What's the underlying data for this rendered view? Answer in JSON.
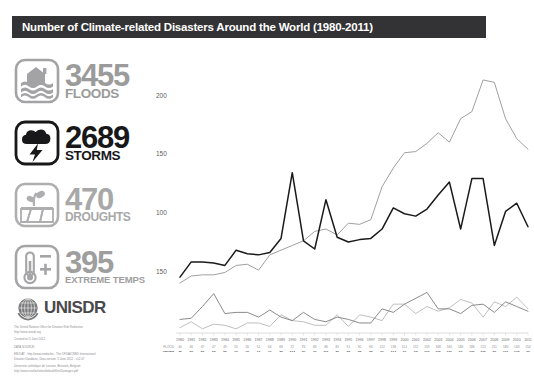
{
  "header": {
    "title": "Number of Climate-related Disasters Around the World (1980-2011)",
    "bar_color": "#333234"
  },
  "stats": [
    {
      "key": "floods",
      "number": "3455",
      "label": "FLOODS",
      "icon": "flood-house-waves-icon",
      "color": "#9b9b9b"
    },
    {
      "key": "storms",
      "number": "2689",
      "label": "STORMS",
      "icon": "storm-cloud-lightning-icon",
      "color": "#18181a"
    },
    {
      "key": "droughts",
      "number": "470",
      "label": "DROUGHTS",
      "icon": "drought-cracked-earth-plant-icon",
      "color": "#a8a8a8"
    },
    {
      "key": "temps",
      "number": "395",
      "label": "EXTREME TEMPS",
      "icon": "thermometer-plus-minus-icon",
      "color": "#9e9e9e"
    }
  ],
  "organization": {
    "logo_icon": "un-globe-laurel-icon",
    "name": "UNISDR",
    "fine_print": [
      "The United Nations Office for Disaster Risk Reduction",
      "http://www.unisdr.org",
      "Created on 5 June 2012",
      "DATA SOURCE:",
      "EM-DAT - http://www.emdat.be - The OFDA/CRED International",
      "Disaster Database, Data version: 5 June 2012 - v12.07",
      "Universite catholique de Louvain, Brussels, Belgium",
      "http://www.cred.be/sites/default/files/Damages.pdf"
    ]
  },
  "chart_data": {
    "type": "line",
    "title": "Number of Climate-related Disasters Around the World (1980-2011)",
    "xlabel": "",
    "ylabel": "",
    "ylim": [
      0,
      230
    ],
    "yticks": [
      50,
      100,
      150,
      200
    ],
    "ytick_labels": [
      "150",
      "100",
      "150",
      "200"
    ],
    "grid": false,
    "legend_position": "left-sidebar-icons",
    "categories": [
      "1980",
      "1981",
      "1982",
      "1983",
      "1984",
      "1985",
      "1986",
      "1987",
      "1988",
      "1989",
      "1990",
      "1991",
      "1992",
      "1993",
      "1994",
      "1995",
      "1996",
      "1997",
      "1998",
      "1999",
      "2000",
      "2001",
      "2002",
      "2003",
      "2004",
      "2005",
      "2006",
      "2007",
      "2008",
      "2009",
      "2010",
      "2011"
    ],
    "series": [
      {
        "name": "FLOOD",
        "color": "#a0a0a2",
        "values": [
          40,
          46,
          47,
          47,
          49,
          55,
          56,
          51,
          64,
          68,
          72,
          76,
          84,
          86,
          81,
          91,
          90,
          94,
          122,
          138,
          151,
          152,
          159,
          168,
          160,
          180,
          186,
          213,
          211,
          180,
          163,
          154
        ]
      },
      {
        "name": "STORM",
        "color": "#1a1a1c",
        "values": [
          45,
          58,
          58,
          57,
          55,
          68,
          65,
          64,
          66,
          78,
          134,
          76,
          69,
          111,
          79,
          75,
          77,
          78,
          86,
          104,
          99,
          97,
          103,
          115,
          126,
          86,
          129,
          129,
          72,
          101,
          108,
          88
        ]
      },
      {
        "name": "DROUGHT",
        "color": "#767678",
        "values": [
          9,
          10,
          20,
          31,
          14,
          15,
          15,
          11,
          17,
          11,
          8,
          15,
          9,
          7,
          11,
          9,
          6,
          6,
          18,
          15,
          22,
          27,
          32,
          18,
          18,
          14,
          21,
          22,
          15,
          24,
          20,
          16
        ]
      },
      {
        "name": "EXTREME TEMPERATURE",
        "color": "#b4b4b6",
        "values": [
          2,
          7,
          1,
          5,
          4,
          1,
          6,
          6,
          3,
          13,
          8,
          7,
          4,
          4,
          13,
          3,
          13,
          11,
          8,
          22,
          22,
          14,
          20,
          16,
          19,
          26,
          23,
          11,
          24,
          20,
          28,
          18
        ]
      }
    ],
    "table": {
      "row_labels": [
        "FLOOD",
        "STORM",
        "DROUGHT",
        "EXTREME TEMPERATURE"
      ],
      "highlight_rows": [
        "STORM"
      ]
    }
  }
}
